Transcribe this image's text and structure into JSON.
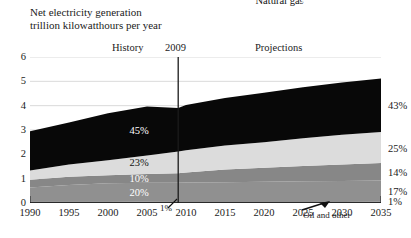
{
  "title": {
    "line1": "Net electricity generation",
    "line2": "trillion kilowatthours per year"
  },
  "eras": {
    "history_label": "History",
    "divider_year": "2009",
    "projections_label": "Projections"
  },
  "annotations": {
    "oil_and_other": "Oil and other",
    "oil_pct_left": "1%"
  },
  "chart_data": {
    "type": "area",
    "title": "Net electricity generation",
    "subtitle": "trillion kilowatthours per year",
    "xlabel": "",
    "ylabel": "trillion kilowatthours per year",
    "xlim": [
      1990,
      2035
    ],
    "ylim": [
      0,
      6
    ],
    "xticks": [
      1990,
      1995,
      2000,
      2005,
      2010,
      2015,
      2020,
      2025,
      2030,
      2035
    ],
    "yticks": [
      0,
      1,
      2,
      3,
      4,
      5,
      6
    ],
    "grid": true,
    "legend": "inline-band-labels",
    "stacked": true,
    "divider_x": 2009,
    "x": [
      1990,
      1995,
      2000,
      2005,
      2009,
      2010,
      2015,
      2020,
      2025,
      2030,
      2035
    ],
    "series": [
      {
        "name": "Oil and other",
        "label": "Oil and other",
        "color": "#3a3a3a",
        "pct_2009": "1%",
        "pct_2035": "1%",
        "values": [
          0.06,
          0.06,
          0.06,
          0.05,
          0.04,
          0.04,
          0.04,
          0.04,
          0.04,
          0.04,
          0.05
        ]
      },
      {
        "name": "Nuclear",
        "label": "Nuclear",
        "color": "#909090",
        "pct_2009": "20%",
        "pct_2035": "17%",
        "values": [
          0.58,
          0.68,
          0.75,
          0.78,
          0.79,
          0.8,
          0.81,
          0.83,
          0.85,
          0.86,
          0.87
        ]
      },
      {
        "name": "Renewable",
        "label": "Renewable",
        "color": "#878787",
        "pct_2009": "10%",
        "pct_2035": "14%",
        "values": [
          0.32,
          0.34,
          0.33,
          0.36,
          0.39,
          0.41,
          0.53,
          0.58,
          0.63,
          0.68,
          0.72
        ]
      },
      {
        "name": "Natural gas",
        "label": "Natural gas",
        "color": "#dcdcdc",
        "pct_2009": "23%",
        "pct_2035": "25%",
        "values": [
          0.38,
          0.5,
          0.62,
          0.76,
          0.9,
          0.92,
          0.98,
          1.05,
          1.14,
          1.22,
          1.28
        ]
      },
      {
        "name": "Coal",
        "label": "Coal",
        "color": "#080808",
        "pct_2009": "45%",
        "pct_2035": "43%",
        "values": [
          1.61,
          1.73,
          1.93,
          2.02,
          1.78,
          1.86,
          1.95,
          2.03,
          2.1,
          2.15,
          2.2
        ]
      }
    ],
    "totals": [
      2.95,
      3.31,
      3.69,
      3.97,
      3.9,
      4.03,
      4.31,
      4.53,
      4.76,
      4.95,
      5.12
    ]
  }
}
